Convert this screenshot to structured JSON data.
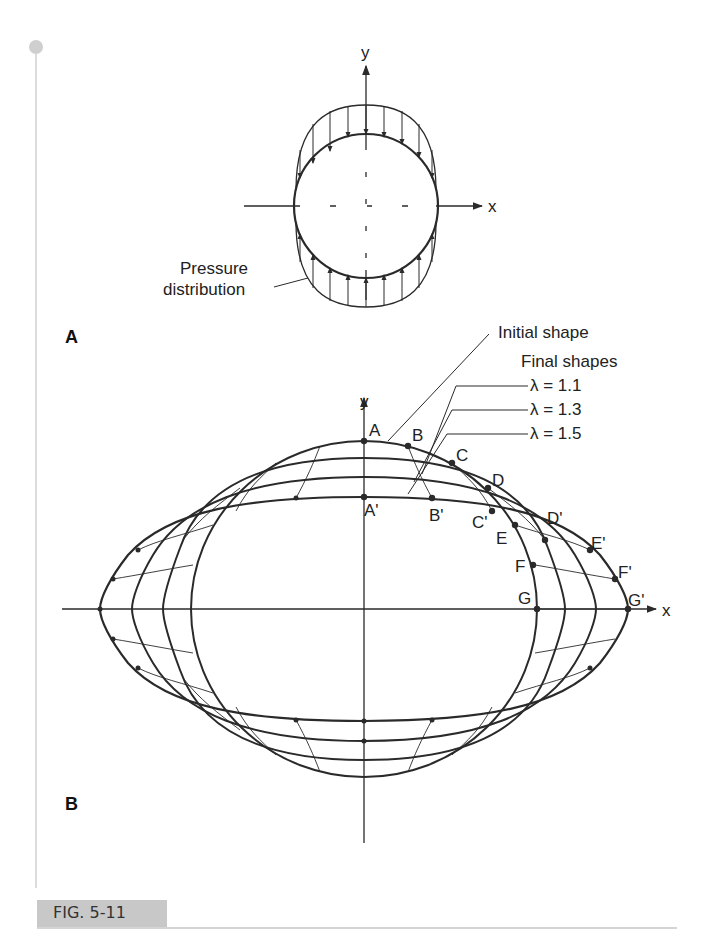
{
  "figure": {
    "caption": "FIG. 5-11",
    "panels": {
      "a": {
        "label": "A",
        "axis_x": "x",
        "axis_y": "y",
        "annotation_line1": "Pressure",
        "annotation_line2": "distribution"
      },
      "b": {
        "label": "B",
        "axis_x": "x",
        "axis_y": "y",
        "initial_shape_label": "Initial shape",
        "final_shapes_label": "Final shapes",
        "lambdas": [
          "λ = 1.1",
          "λ = 1.3",
          "λ = 1.5"
        ],
        "points_initial": [
          "A",
          "B",
          "C",
          "D",
          "E",
          "F",
          "G"
        ],
        "points_final": [
          "A'",
          "B'",
          "C'",
          "D'",
          "E'",
          "F'",
          "G'"
        ]
      }
    }
  },
  "colors": {
    "line": "#2a2a2a",
    "accent_gray": "#c8c8c8"
  }
}
